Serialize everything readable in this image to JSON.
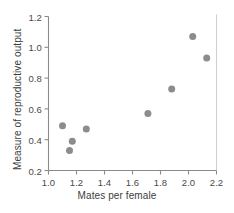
{
  "chart_data": {
    "type": "scatter",
    "title": "",
    "xlabel": "Mates per female",
    "ylabel": "Measure of reproductive output",
    "xlim": [
      1.0,
      2.2
    ],
    "ylim": [
      0.2,
      1.2
    ],
    "xticks": [
      "1.0",
      "1.2",
      "1.4",
      "1.6",
      "1.8",
      "2.0",
      "2.2"
    ],
    "yticks": [
      "0.2",
      "0.4",
      "0.6",
      "0.8",
      "1.0",
      "1.2"
    ],
    "xtick_values": [
      1.0,
      1.2,
      1.4,
      1.6,
      1.8,
      2.0,
      2.2
    ],
    "ytick_values": [
      0.2,
      0.4,
      0.6,
      0.8,
      1.0,
      1.2
    ],
    "grid": false,
    "legend": "none",
    "marker": {
      "shape": "circle",
      "color": "#8c8c8c",
      "size": 7
    },
    "axis_color": "#8a8a8a",
    "points": [
      {
        "x": 1.1,
        "y": 0.49
      },
      {
        "x": 1.15,
        "y": 0.33
      },
      {
        "x": 1.17,
        "y": 0.39
      },
      {
        "x": 1.27,
        "y": 0.47
      },
      {
        "x": 1.71,
        "y": 0.57
      },
      {
        "x": 1.88,
        "y": 0.73
      },
      {
        "x": 2.03,
        "y": 1.07
      },
      {
        "x": 2.13,
        "y": 0.93
      }
    ]
  }
}
